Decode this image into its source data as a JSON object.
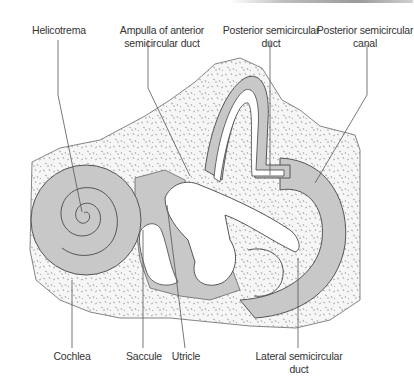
{
  "figure": {
    "type": "anatomical-diagram",
    "colors": {
      "bone_fill": "#f4f4f4",
      "bone_stipple": "#8a8a8a",
      "membranous_fill": "#c8c8c8",
      "duct_fill": "#ffffff",
      "outline": "#555555",
      "label_text": "#333333",
      "leader_line": "#555555"
    }
  },
  "labels": {
    "helicotrema": {
      "line1": "Helicotrema",
      "line2": ""
    },
    "ampulla": {
      "line1": "Ampulla of anterior",
      "line2": "semicircular duct"
    },
    "posterior_duct": {
      "line1": "Posterior semicircular",
      "line2": "duct"
    },
    "posterior_canal": {
      "line1": "Posterior semicircular",
      "line2": "canal"
    },
    "cochlea": {
      "line1": "Cochlea"
    },
    "saccule": {
      "line1": "Saccule"
    },
    "utricle": {
      "line1": "Utricle"
    },
    "lateral_duct": {
      "line1": "Lateral semicircular",
      "line2": "duct"
    }
  }
}
